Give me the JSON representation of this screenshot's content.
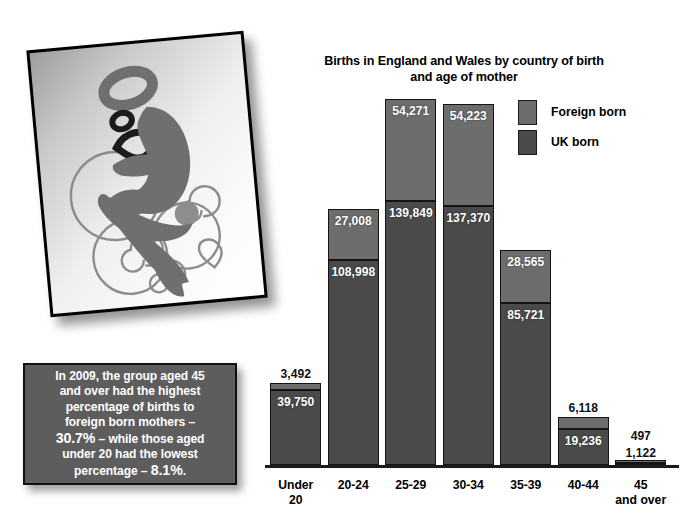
{
  "artwork": {
    "name": "mother-and-child-illustration",
    "description": "Stylised grey silhouette of a mother holding a baby surrounded by swirls and a heart outline"
  },
  "callout": {
    "lines": [
      "In 2009, the group aged 45",
      "and over had the highest",
      "percentage of births to",
      "foreign born mothers –"
    ],
    "line5_big": "30.7%",
    "line5_rest": " – while those aged",
    "line6": "under 20 had the lowest",
    "line7_rest": "percentage – ",
    "line7_big": "8.1%",
    "line7_end": "."
  },
  "chart_data": {
    "type": "bar",
    "stacked": true,
    "title": "Births in England and Wales by country of birth and age of mother",
    "title_line1": "Births in England and Wales by country of birth",
    "title_line2": "and age of mother",
    "xlabel": "",
    "ylabel": "",
    "ylim": [
      0,
      200000
    ],
    "grid": false,
    "legend_position": "top-right",
    "categories": [
      "Under 20",
      "20-24",
      "25-29",
      "30-34",
      "35-39",
      "40-44",
      "45 and over"
    ],
    "category_lines": [
      [
        "Under",
        "20"
      ],
      [
        "20-24"
      ],
      [
        "25-29"
      ],
      [
        "30-34"
      ],
      [
        "35-39"
      ],
      [
        "40-44"
      ],
      [
        "45",
        "and over"
      ]
    ],
    "series": [
      {
        "name": "UK born",
        "color": "#4a4a4a",
        "values": [
          39750,
          108998,
          139849,
          137370,
          85721,
          19236,
          1122
        ],
        "labels": [
          "39,750",
          "108,998",
          "139,849",
          "137,370",
          "85,721",
          "19,236",
          "1,122"
        ]
      },
      {
        "name": "Foreign born",
        "color": "#6d6d6d",
        "values": [
          3492,
          27008,
          54271,
          54223,
          28565,
          6118,
          497
        ],
        "labels": [
          "3,492",
          "27,008",
          "54,271",
          "54,223",
          "28,565",
          "6,118",
          "497"
        ]
      }
    ],
    "legend": [
      {
        "label": "Foreign born",
        "color": "#6d6d6d"
      },
      {
        "label": "UK born",
        "color": "#4a4a4a"
      }
    ]
  }
}
